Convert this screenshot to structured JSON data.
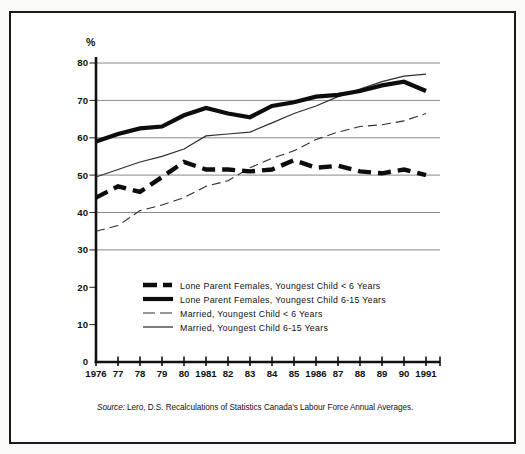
{
  "percent_label": "%",
  "source_line": {
    "prefix": "Source:",
    "text": " Lero, D.S. Recalculations of Statistics Canada's Labour Force Annual Averages."
  },
  "colors": {
    "line_black": "#0d0d0d",
    "thin_line_gray": "#2f2f2f",
    "gridline": "#7c7c7c",
    "frame_border": "#1a1a1a",
    "background": "#ffffff"
  },
  "chart_data": {
    "type": "line",
    "title": "",
    "ylabel": "%",
    "xlabel": "",
    "ylim": [
      0,
      80
    ],
    "ytick_interval": 10,
    "grid": "horizontal",
    "gridlines_at": [
      30,
      40,
      50,
      60,
      70,
      80
    ],
    "legend_position": "inside lower-center",
    "x": [
      1976,
      1977,
      1978,
      1979,
      1980,
      1981,
      1982,
      1983,
      1984,
      1985,
      1986,
      1987,
      1988,
      1989,
      1990,
      1991
    ],
    "x_tick_labels": [
      "1976",
      "77",
      "78",
      "79",
      "80",
      "1981",
      "82",
      "83",
      "84",
      "85",
      "1986",
      "87",
      "88",
      "89",
      "90",
      "1991"
    ],
    "y_tick_labels": [
      "0",
      "10",
      "20",
      "30",
      "40",
      "50",
      "60",
      "70",
      "80"
    ],
    "series": [
      {
        "name": "Lone Parent Females, Youngest Child < 6 Years",
        "style": "thick-dashed",
        "values": [
          44,
          47,
          45.5,
          49.5,
          53.5,
          51.5,
          51.5,
          51,
          51.5,
          54,
          52,
          52.5,
          51,
          50.5,
          51.5,
          50
        ]
      },
      {
        "name": "Lone Parent Females, Youngest Child 6-15 Years",
        "style": "thick-solid",
        "values": [
          59,
          61,
          62.5,
          63,
          66,
          68,
          66.5,
          65.5,
          68.5,
          69.5,
          71,
          71.5,
          72.5,
          74,
          75,
          72.5
        ]
      },
      {
        "name": "Married, Youngest Child < 6 Years",
        "style": "thin-dashed",
        "values": [
          35,
          36.5,
          40.5,
          42,
          44,
          47,
          48.5,
          52,
          54.5,
          56.5,
          59.5,
          61.5,
          63,
          63.5,
          64.5,
          66.5
        ]
      },
      {
        "name": "Married, Youngest Child 6-15 Years",
        "style": "thin-solid",
        "values": [
          49.5,
          51.5,
          53.5,
          55,
          57,
          60.5,
          61,
          61.5,
          64,
          66.5,
          68.5,
          71,
          73,
          75,
          76.5,
          77
        ]
      }
    ],
    "source": "Source: Lero, D.S. Recalculations of Statistics Canada's Labour Force Annual Averages."
  }
}
